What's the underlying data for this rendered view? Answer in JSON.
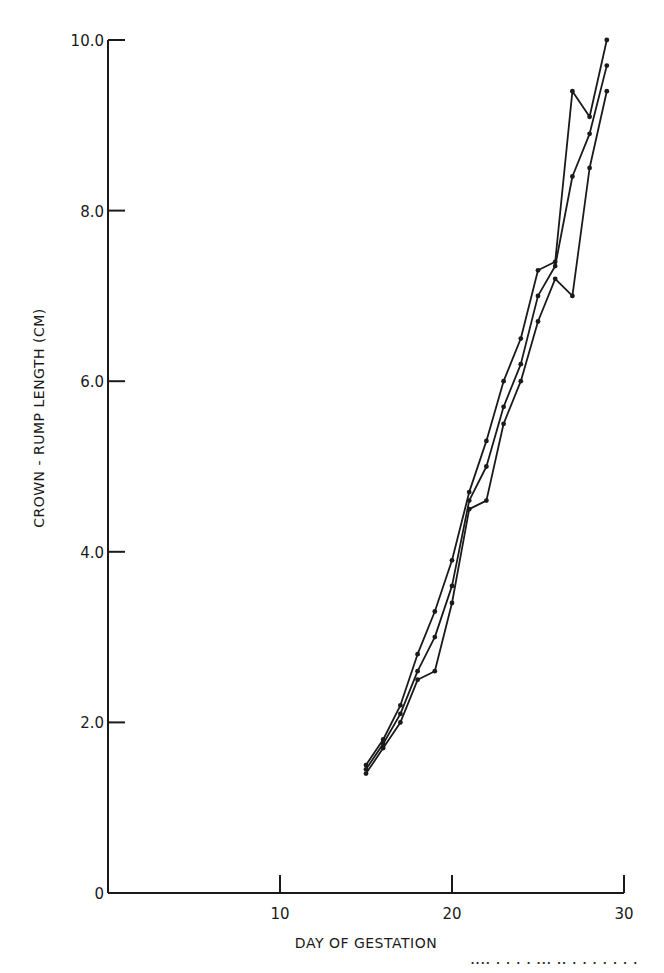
{
  "chart_data": {
    "type": "line",
    "title": "",
    "xlabel": "DAY OF GESTATION",
    "ylabel": "CROWN - RUMP LENGTH (CM)",
    "xlim": [
      0,
      30
    ],
    "ylim": [
      0,
      10
    ],
    "x_ticks": [
      0,
      10,
      20,
      30
    ],
    "x_tick_labels": [
      "",
      "10",
      "20",
      "30"
    ],
    "y_ticks": [
      0,
      2,
      4,
      6,
      8,
      10
    ],
    "y_tick_labels": [
      "0",
      "2.0",
      "4.0",
      "6.0",
      "8.0",
      "10.0"
    ],
    "grid": false,
    "legend": null,
    "x": [
      15,
      16,
      17,
      18,
      19,
      20,
      21,
      22,
      23,
      24,
      25,
      26,
      27,
      28,
      29
    ],
    "series": [
      {
        "name": "Series A",
        "values": [
          1.5,
          1.8,
          2.2,
          2.8,
          3.3,
          3.9,
          4.7,
          5.3,
          6.0,
          6.5,
          7.3,
          7.4,
          9.4,
          9.1,
          10.0
        ]
      },
      {
        "name": "Series B",
        "values": [
          1.45,
          1.75,
          2.1,
          2.6,
          3.0,
          3.6,
          4.6,
          5.0,
          5.7,
          6.2,
          7.0,
          7.35,
          8.4,
          8.9,
          9.7
        ]
      },
      {
        "name": "Series C",
        "values": [
          1.4,
          1.7,
          2.0,
          2.5,
          2.6,
          3.4,
          4.5,
          4.6,
          5.5,
          6.0,
          6.7,
          7.2,
          7.0,
          8.5,
          9.4
        ]
      }
    ],
    "colors": {
      "line": "#1a1a1a",
      "marker": "#1a1a1a",
      "background": "#ffffff"
    }
  },
  "caption_fragment": "····  ·  · · ·  ···   ··  ·   · ·  ·  ·   ·  ·"
}
